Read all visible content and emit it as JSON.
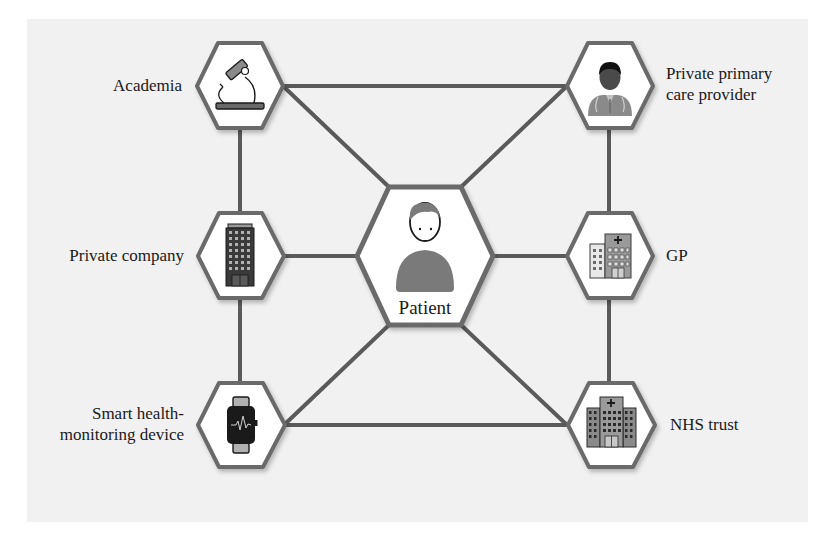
{
  "diagram": {
    "title": "",
    "center_node": {
      "id": "patient",
      "label": "Patient",
      "icon": "person-icon"
    },
    "nodes": [
      {
        "id": "academia",
        "label": "Academia",
        "icon": "microscope-icon",
        "side": "left",
        "row": 1
      },
      {
        "id": "private_company",
        "label": "Private company",
        "icon": "office-building-icon",
        "side": "left",
        "row": 2
      },
      {
        "id": "smart_device",
        "label_line1": "Smart health-",
        "label_line2": "monitoring device",
        "label": "Smart health-monitoring device",
        "icon": "smartwatch-icon",
        "side": "left",
        "row": 3
      },
      {
        "id": "private_primary_care",
        "label_line1": "Private primary",
        "label_line2": "care provider",
        "label": "Private primary care provider",
        "icon": "doctor-icon",
        "side": "right",
        "row": 1
      },
      {
        "id": "gp",
        "label": "GP",
        "icon": "clinic-building-icon",
        "side": "right",
        "row": 2
      },
      {
        "id": "nhs_trust",
        "label": "NHS trust",
        "icon": "hospital-icon",
        "side": "right",
        "row": 3
      }
    ],
    "edges": [
      [
        "academia",
        "private_primary_care"
      ],
      [
        "academia",
        "private_company"
      ],
      [
        "academia",
        "patient"
      ],
      [
        "private_company",
        "smart_device"
      ],
      [
        "private_company",
        "patient"
      ],
      [
        "smart_device",
        "patient"
      ],
      [
        "smart_device",
        "nhs_trust"
      ],
      [
        "private_primary_care",
        "patient"
      ],
      [
        "private_primary_care",
        "gp"
      ],
      [
        "gp",
        "patient"
      ],
      [
        "gp",
        "nhs_trust"
      ],
      [
        "nhs_trust",
        "patient"
      ]
    ],
    "colors": {
      "background": "#f1f1f1",
      "edge": "#5a5a5a",
      "hex_fill": "#ffffff",
      "hex_stroke": "#6a6a6a",
      "icon_dark": "#2a2a2a",
      "icon_gray": "#8a8a8a"
    }
  }
}
